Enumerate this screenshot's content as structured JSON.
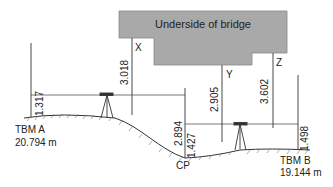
{
  "bridge": {
    "label": "Underside of bridge",
    "fill": "#a9a9a9"
  },
  "points": {
    "X": "X",
    "Y": "Y",
    "Z": "Z",
    "CP": "CP"
  },
  "benchmarks": {
    "A": {
      "name": "TBM A",
      "level": "20.794 m"
    },
    "B": {
      "name": "TBM B",
      "level": "19.144 m"
    }
  },
  "staff_readings": {
    "tbm_a_backsight": "1.317",
    "x_inverted": "3.018",
    "cp_foresight": "2.894",
    "cp_backsight": "1.427",
    "y_inverted": "2.905",
    "z_inverted": "3.602",
    "tbm_b_foresight": "1.498"
  }
}
